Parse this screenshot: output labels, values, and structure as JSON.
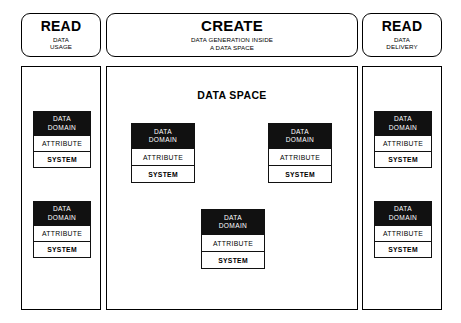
{
  "diagram": {
    "columns": [
      {
        "id": "read-data-usage",
        "header": {
          "title": "READ",
          "sub_line1": "DATA",
          "sub_line2": "USAGE"
        },
        "panel_title": "",
        "cards": [
          {
            "head_line1": "DATA",
            "head_line2": "DOMAIN",
            "attribute": "ATTRIBUTE",
            "system": "SYSTEM"
          },
          {
            "head_line1": "DATA",
            "head_line2": "DOMAIN",
            "attribute": "ATTRIBUTE",
            "system": "SYSTEM"
          }
        ]
      },
      {
        "id": "create-data-space",
        "header": {
          "title": "CREATE",
          "sub_line1": "DATA GENERATION INSIDE",
          "sub_line2": "A DATA SPACE"
        },
        "panel_title": "DATA SPACE",
        "cards": [
          {
            "head_line1": "DATA",
            "head_line2": "DOMAIN",
            "attribute": "ATTRIBUTE",
            "system": "SYSTEM"
          },
          {
            "head_line1": "DATA",
            "head_line2": "DOMAIN",
            "attribute": "ATTRIBUTE",
            "system": "SYSTEM"
          },
          {
            "head_line1": "DATA",
            "head_line2": "DOMAIN",
            "attribute": "ATTRIBUTE",
            "system": "SYSTEM"
          }
        ]
      },
      {
        "id": "read-data-delivery",
        "header": {
          "title": "READ",
          "sub_line1": "DATA",
          "sub_line2": "DELIVERY"
        },
        "panel_title": "",
        "cards": [
          {
            "head_line1": "DATA",
            "head_line2": "DOMAIN",
            "attribute": "ATTRIBUTE",
            "system": "SYSTEM"
          },
          {
            "head_line1": "DATA",
            "head_line2": "DOMAIN",
            "attribute": "ATTRIBUTE",
            "system": "SYSTEM"
          }
        ]
      }
    ],
    "colors": {
      "stroke": "#111111",
      "card_header_fill": "#111111",
      "card_header_text": "#ffffff",
      "background": "#ffffff"
    }
  }
}
